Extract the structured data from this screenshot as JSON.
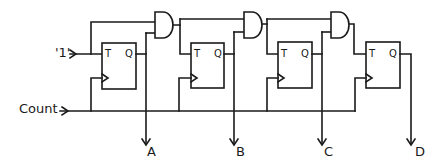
{
  "diagram": {
    "type": "synchronous 4-bit counter (T flip-flops with AND carry chain)",
    "inputs": {
      "logic_one": "'1'",
      "clock": "Count"
    },
    "flip_flops": [
      {
        "id": "ff1",
        "t_label": "T",
        "q_label": "Q",
        "output": "A"
      },
      {
        "id": "ff2",
        "t_label": "T",
        "q_label": "Q",
        "output": "B"
      },
      {
        "id": "ff3",
        "t_label": "T",
        "q_label": "Q",
        "output": "C"
      },
      {
        "id": "ff4",
        "t_label": "T",
        "q_label": "Q",
        "output": "D"
      }
    ],
    "gates": [
      {
        "id": "and1",
        "kind": "AND",
        "inputs": [
          "'1'",
          "A"
        ],
        "drives": "ff2.T"
      },
      {
        "id": "and2",
        "kind": "AND",
        "inputs": [
          "and1",
          "B"
        ],
        "drives": "ff3.T"
      },
      {
        "id": "and3",
        "kind": "AND",
        "inputs": [
          "and2",
          "C"
        ],
        "drives": "ff4.T"
      }
    ],
    "outputs": [
      "A",
      "B",
      "C",
      "D"
    ],
    "colors": {
      "ink": "#1a1a1a",
      "background": "#ffffff"
    }
  }
}
